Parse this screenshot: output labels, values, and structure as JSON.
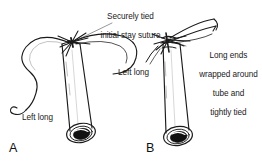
{
  "figure": {
    "background_color": "#ffffff",
    "ink_color": "#1a1a1a",
    "width": 262,
    "height": 167
  },
  "annotations": {
    "stay_suture": {
      "line1": "Securely tied",
      "line2": "initial stay suture"
    },
    "long_ends": {
      "line1": "Long ends",
      "line2": "wrapped around",
      "line3": "tube and",
      "line4": "tightly tied"
    },
    "left_long_a": "Left long",
    "left_long_b": "Left long"
  },
  "panels": [
    {
      "letter": "A",
      "name": "panel-a",
      "description": "Tube with securely tied initial stay suture and long free ends"
    },
    {
      "letter": "B",
      "name": "panel-b",
      "description": "Tube with long suture ends wrapped around tube and tightly tied"
    }
  ]
}
